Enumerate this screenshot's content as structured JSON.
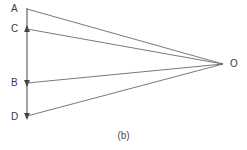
{
  "figure": {
    "caption": "(b)",
    "caption_position": {
      "x": 0,
      "y": 130
    },
    "width": 247,
    "height": 150,
    "background_color": "#ffffff",
    "line_color": "#555555",
    "text_color": "#3b3b3b",
    "axis": {
      "name": "vertical-axis",
      "x": 27,
      "y_top": 8,
      "y_bottom": 118,
      "arrowheads": [
        {
          "at": "C",
          "y": 29,
          "direction": "up"
        },
        {
          "at": "B",
          "y": 83,
          "direction": "down"
        },
        {
          "at": "D",
          "y": 117,
          "direction": "down"
        }
      ]
    },
    "points": [
      {
        "id": "A",
        "label": "A",
        "x": 27,
        "y": 9,
        "label_x": 11,
        "label_y": 4
      },
      {
        "id": "C",
        "label": "C",
        "x": 27,
        "y": 29,
        "label_x": 11,
        "label_y": 24
      },
      {
        "id": "B",
        "label": "B",
        "x": 27,
        "y": 83,
        "label_x": 11,
        "label_y": 78
      },
      {
        "id": "D",
        "label": "D",
        "x": 27,
        "y": 116,
        "label_x": 11,
        "label_y": 113
      },
      {
        "id": "O",
        "label": "O",
        "x": 223,
        "y": 64,
        "label_x": 230,
        "label_y": 59
      }
    ],
    "rays": [
      {
        "name": "ray-A-O",
        "from": "A",
        "to": "O",
        "x1": 27,
        "y1": 9,
        "x2": 223,
        "y2": 64
      },
      {
        "name": "ray-C-O",
        "from": "C",
        "to": "O",
        "x1": 27,
        "y1": 29,
        "x2": 223,
        "y2": 64
      },
      {
        "name": "ray-B-O",
        "from": "B",
        "to": "O",
        "x1": 27,
        "y1": 83,
        "x2": 223,
        "y2": 64
      },
      {
        "name": "ray-D-O",
        "from": "D",
        "to": "O",
        "x1": 27,
        "y1": 116,
        "x2": 223,
        "y2": 64
      }
    ]
  }
}
